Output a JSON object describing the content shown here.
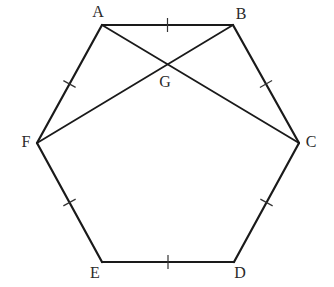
{
  "diagram": {
    "colors": {
      "stroke": "#1a1a1a",
      "label": "#2a2a2a",
      "background": "#ffffff"
    },
    "vertices": [
      {
        "id": "A",
        "label": "A",
        "x": 102,
        "y": 25,
        "label_x": 98,
        "label_y": 13
      },
      {
        "id": "B",
        "label": "B",
        "x": 233,
        "y": 25,
        "label_x": 241,
        "label_y": 15
      },
      {
        "id": "C",
        "label": "C",
        "x": 299,
        "y": 143,
        "label_x": 311,
        "label_y": 143
      },
      {
        "id": "D",
        "label": "D",
        "x": 234,
        "y": 262,
        "label_x": 240,
        "label_y": 274
      },
      {
        "id": "E",
        "label": "E",
        "x": 102,
        "y": 262,
        "label_x": 95,
        "label_y": 274
      },
      {
        "id": "F",
        "label": "F",
        "x": 37,
        "y": 143,
        "label_x": 26,
        "label_y": 143
      }
    ],
    "intersection": {
      "id": "G",
      "label": "G",
      "x": 167,
      "y": 64,
      "label_x": 165,
      "label_y": 83
    },
    "edges": [
      {
        "from": "A",
        "to": "B",
        "tick": true
      },
      {
        "from": "B",
        "to": "C",
        "tick": true
      },
      {
        "from": "C",
        "to": "D",
        "tick": true
      },
      {
        "from": "D",
        "to": "E",
        "tick": true
      },
      {
        "from": "E",
        "to": "F",
        "tick": true
      },
      {
        "from": "F",
        "to": "A",
        "tick": true
      }
    ],
    "diagonals": [
      {
        "from": "A",
        "to": "C"
      },
      {
        "from": "B",
        "to": "F"
      }
    ]
  }
}
